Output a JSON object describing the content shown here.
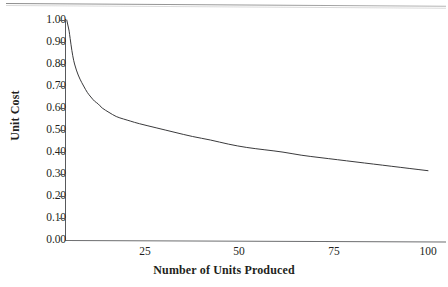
{
  "figure": {
    "background_color": "#ffffff",
    "ink_color": "#231f20",
    "axis_color": "#58595b",
    "page_rule_color": "#8d8d8d"
  },
  "chart_data": {
    "type": "line",
    "title": "",
    "xlabel": "Number of Units Produced",
    "ylabel": "Unit Cost",
    "xlim": [
      0,
      100
    ],
    "ylim": [
      0.0,
      1.0
    ],
    "grid": false,
    "legend": null,
    "x_tick_labels": [
      "25",
      "50",
      "75",
      "100"
    ],
    "x_tick_values": [
      25,
      50,
      75,
      100
    ],
    "y_tick_labels": [
      "0.00",
      "0.10",
      "0.20",
      "0.30",
      "0.40",
      "0.50",
      "0.60",
      "0.70",
      "0.80",
      "0.90",
      "1.00"
    ],
    "y_tick_values": [
      0.0,
      0.1,
      0.2,
      0.3,
      0.4,
      0.5,
      0.6,
      0.7,
      0.8,
      0.9,
      1.0
    ],
    "series": [
      {
        "name": "Unit Cost",
        "x": [
          1,
          2,
          3,
          4,
          5,
          6,
          7,
          8,
          9,
          10,
          12,
          14,
          16,
          18,
          20,
          25,
          30,
          35,
          40,
          45,
          50,
          55,
          60,
          65,
          70,
          75,
          80,
          85,
          90,
          95,
          100
        ],
        "values": [
          0.95,
          0.83,
          0.77,
          0.73,
          0.7,
          0.67,
          0.65,
          0.63,
          0.62,
          0.6,
          0.58,
          0.56,
          0.55,
          0.54,
          0.53,
          0.51,
          0.49,
          0.47,
          0.455,
          0.435,
          0.42,
          0.41,
          0.4,
          0.385,
          0.375,
          0.365,
          0.355,
          0.345,
          0.335,
          0.325,
          0.315
        ]
      }
    ]
  }
}
